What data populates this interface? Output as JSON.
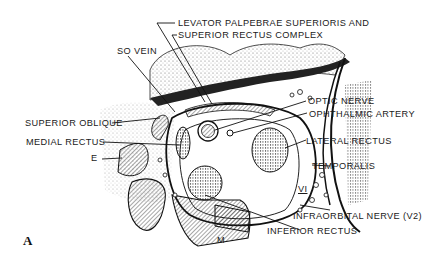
{
  "figure": {
    "panel_letter": "A",
    "ink_color": "#1a1a1a",
    "background": "#ffffff"
  },
  "labels": {
    "levator_line1": "LEVATOR PALPEBRAE SUPERIORIS AND",
    "levator_line2": "SUPERIOR RECTUS COMPLEX",
    "so_vein": "SO VEIN",
    "superior_oblique": "SUPERIOR OBLIQUE",
    "medial_rectus": "MEDIAL RECTUS",
    "e": "E",
    "optic_nerve": "OPTIC NERVE",
    "ophthalmic_artery": "OPHTHALMIC ARTERY",
    "lateral_rectus": "LATERAL RECTUS",
    "temporalis": "TEMPORALIS",
    "vi": "VI",
    "infraorbital_nerve": "INFRAORBITAL NERVE (V2)",
    "inferior_rectus": "INFERIOR RECTUS",
    "m": "M"
  }
}
